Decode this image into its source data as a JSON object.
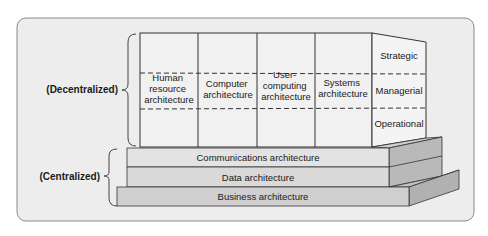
{
  "diagram": {
    "groups": {
      "decentralized": "(Decentralized)",
      "centralized": "(Centralized)"
    },
    "columns": [
      {
        "lines": [
          "Human",
          "resource",
          "architecture"
        ]
      },
      {
        "lines": [
          "Computer",
          "architecture"
        ]
      },
      {
        "lines": [
          "User-",
          "computing",
          "architecture"
        ]
      },
      {
        "lines": [
          "Systems",
          "architecture"
        ]
      }
    ],
    "levels": [
      "Strategic",
      "Managerial",
      "Operational"
    ],
    "foundation": [
      "Communications architecture",
      "Data architecture",
      "Business architecture"
    ],
    "colors": {
      "panel": "#ededed",
      "panel_border": "#8a8a8a",
      "grid_fill": "#efefef",
      "bar_comm": "#e2e2e2",
      "bar_data": "#d8d8d8",
      "bar_business": "#cfcfcf",
      "side_face": "#b8b8b8",
      "top_face": "#c8c8c8",
      "stroke": "#333333"
    }
  }
}
